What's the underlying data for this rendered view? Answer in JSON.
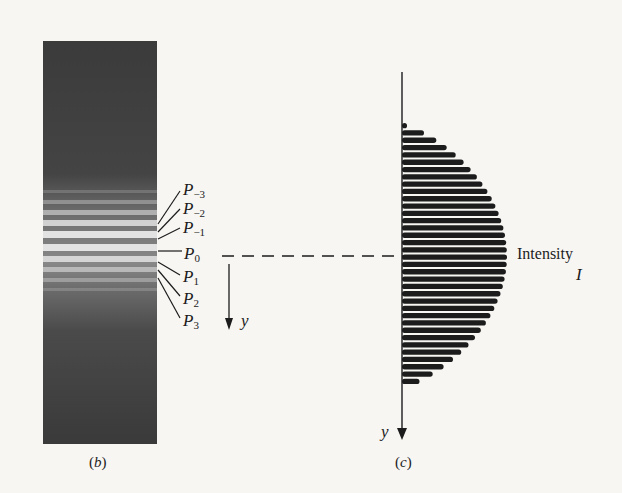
{
  "figure": {
    "panel_b": {
      "caption_open": "(",
      "caption_letter": "b",
      "caption_close": ")",
      "description": "Photographic interference/diffraction fringe pattern: dark strip with bright bands near center",
      "fringe_labels": [
        {
          "base": "P",
          "sub": "−3"
        },
        {
          "base": "P",
          "sub": "−2"
        },
        {
          "base": "P",
          "sub": "−1"
        },
        {
          "base": "P",
          "sub": "0"
        },
        {
          "base": "P",
          "sub": "1"
        },
        {
          "base": "P",
          "sub": "2"
        },
        {
          "base": "P",
          "sub": "3"
        }
      ],
      "axis_label": "y"
    },
    "panel_c": {
      "caption_open": "(",
      "caption_letter": "c",
      "caption_close": ")",
      "intensity_label": "Intensity",
      "intensity_symbol": "I",
      "axis_label": "y"
    },
    "colors": {
      "ink": "#1c1c1c",
      "paper": "#f7f6f3",
      "strip_dark": "#3a3a3a"
    }
  },
  "chart_data": {
    "type": "area",
    "title": "",
    "xlabel": "Intensity I",
    "ylabel": "y",
    "envelope": "peaked at center (y=0), falling to zero at top and bottom edges",
    "fringe_count_approx": 36,
    "center_index_label": "P0"
  }
}
